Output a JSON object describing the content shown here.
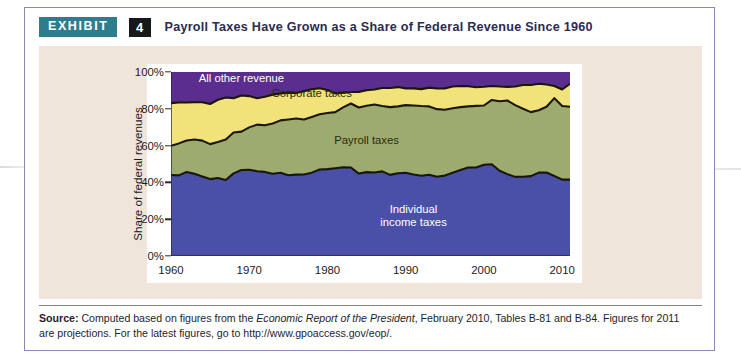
{
  "exhibit": {
    "badge_label": "EXHIBIT",
    "number": "4",
    "title": "Payroll Taxes Have Grown as a Share of Federal Revenue Since 1960"
  },
  "source": {
    "label": "Source:",
    "text_before_italic": " Computed based on figures from the ",
    "italic_text": "Economic Report of the President",
    "text_after_italic": ", February 2010, Tables B-81 and B-84. Figures for 2011 are projections. For the latest figures, go to http://www.gpoaccess.gov/eop/."
  },
  "colors": {
    "card_border": "#8b87b8",
    "panel_background": "#efe5da",
    "badge_exhibit": "#2e7d8e",
    "badge_number": "#17181a",
    "title_text": "#2c2b4f",
    "individual_income_taxes": "#4a4fa8",
    "payroll_taxes": "#9dab6e",
    "corporate_taxes": "#f2e27a",
    "all_other_revenue": "#5b2d8e",
    "series_outline": "#1a1608"
  },
  "chart_data": {
    "type": "area",
    "stacked": true,
    "title": "Payroll Taxes Have Grown as a Share of Federal Revenue Since 1960",
    "xlabel": "",
    "ylabel": "Share of federal revenues",
    "ylim": [
      0,
      100
    ],
    "xlim": [
      1960,
      2011
    ],
    "yticks": [
      "0%",
      "20%",
      "40%",
      "60%",
      "80%",
      "100%"
    ],
    "ytick_values": [
      0,
      20,
      40,
      60,
      80,
      100
    ],
    "xticks": [
      "1960",
      "1970",
      "1980",
      "1990",
      "2000",
      "2010"
    ],
    "xtick_values": [
      1960,
      1970,
      1980,
      1990,
      2000,
      2010
    ],
    "minor_xtick_interval": 1,
    "grid": false,
    "legend": "in-plot labels",
    "x": [
      1960,
      1961,
      1962,
      1963,
      1964,
      1965,
      1966,
      1967,
      1968,
      1969,
      1970,
      1971,
      1972,
      1973,
      1974,
      1975,
      1976,
      1977,
      1978,
      1979,
      1980,
      1981,
      1982,
      1983,
      1984,
      1985,
      1986,
      1987,
      1988,
      1989,
      1990,
      1991,
      1992,
      1993,
      1994,
      1995,
      1996,
      1997,
      1998,
      1999,
      2000,
      2001,
      2002,
      2003,
      2004,
      2005,
      2006,
      2007,
      2008,
      2009,
      2010,
      2011
    ],
    "series": [
      {
        "name": "Individual income taxes",
        "label_lines": [
          "Individual",
          "income taxes"
        ],
        "color": "#4a4fa8",
        "label_color": "#ffffff",
        "values": [
          44.0,
          43.8,
          45.7,
          44.7,
          43.2,
          41.8,
          42.4,
          41.3,
          44.9,
          46.7,
          46.9,
          46.1,
          45.7,
          44.7,
          45.2,
          43.9,
          44.2,
          44.3,
          45.3,
          47.0,
          47.2,
          47.7,
          48.2,
          48.1,
          44.8,
          45.6,
          45.4,
          46.0,
          44.1,
          45.0,
          45.2,
          44.3,
          43.6,
          44.2,
          43.1,
          43.7,
          45.2,
          46.7,
          48.1,
          48.1,
          49.6,
          49.9,
          46.3,
          44.5,
          43.0,
          43.1,
          43.4,
          45.3,
          45.4,
          43.5,
          41.5,
          41.5
        ]
      },
      {
        "name": "Payroll taxes",
        "label_lines": [
          "Payroll taxes"
        ],
        "color": "#9dab6e",
        "label_color": "#2b2b0f",
        "values": [
          15.9,
          17.4,
          17.1,
          18.6,
          19.5,
          19.0,
          19.5,
          22.0,
          22.2,
          20.9,
          23.0,
          25.3,
          25.4,
          27.3,
          28.5,
          30.3,
          30.5,
          29.9,
          30.3,
          30.0,
          30.5,
          30.5,
          32.6,
          34.8,
          35.9,
          36.1,
          36.9,
          35.5,
          36.8,
          36.3,
          36.8,
          37.5,
          37.9,
          37.1,
          36.7,
          35.8,
          35.1,
          34.2,
          33.2,
          33.5,
          32.2,
          34.9,
          37.8,
          40.0,
          39.0,
          36.9,
          34.8,
          33.9,
          35.7,
          42.3,
          40.0,
          39.6
        ]
      },
      {
        "name": "Corporate taxes",
        "label_lines": [
          "Corporate taxes"
        ],
        "color": "#f2e27a",
        "label_color": "#2b2b0f",
        "values": [
          23.2,
          22.2,
          20.6,
          20.3,
          20.9,
          21.8,
          23.0,
          22.8,
          18.7,
          19.6,
          17.0,
          14.3,
          15.5,
          15.7,
          14.7,
          14.6,
          13.9,
          15.4,
          15.0,
          14.2,
          12.5,
          10.2,
          8.0,
          6.2,
          8.5,
          8.4,
          8.2,
          9.8,
          10.4,
          10.5,
          9.1,
          9.3,
          9.2,
          10.2,
          11.2,
          11.6,
          11.8,
          11.5,
          11.0,
          10.1,
          10.2,
          7.6,
          8.0,
          7.4,
          10.1,
          12.9,
          14.7,
          14.4,
          12.1,
          6.6,
          9.0,
          12.5
        ]
      },
      {
        "name": "All other revenue",
        "label_lines": [
          "All other revenue"
        ],
        "color": "#5b2d8e",
        "label_color": "#ffffff",
        "values": [
          16.9,
          16.6,
          16.6,
          16.4,
          16.4,
          17.4,
          15.1,
          13.9,
          14.2,
          12.8,
          13.1,
          14.3,
          13.4,
          12.3,
          11.6,
          11.2,
          11.4,
          10.4,
          9.4,
          8.8,
          9.8,
          11.6,
          11.2,
          10.9,
          10.8,
          9.9,
          9.5,
          8.7,
          8.7,
          8.2,
          8.9,
          8.9,
          9.3,
          8.5,
          9.0,
          8.9,
          7.9,
          7.6,
          7.7,
          8.3,
          8.0,
          7.6,
          7.9,
          8.1,
          7.9,
          7.1,
          7.1,
          6.4,
          6.8,
          7.6,
          9.5,
          6.4
        ]
      }
    ]
  }
}
